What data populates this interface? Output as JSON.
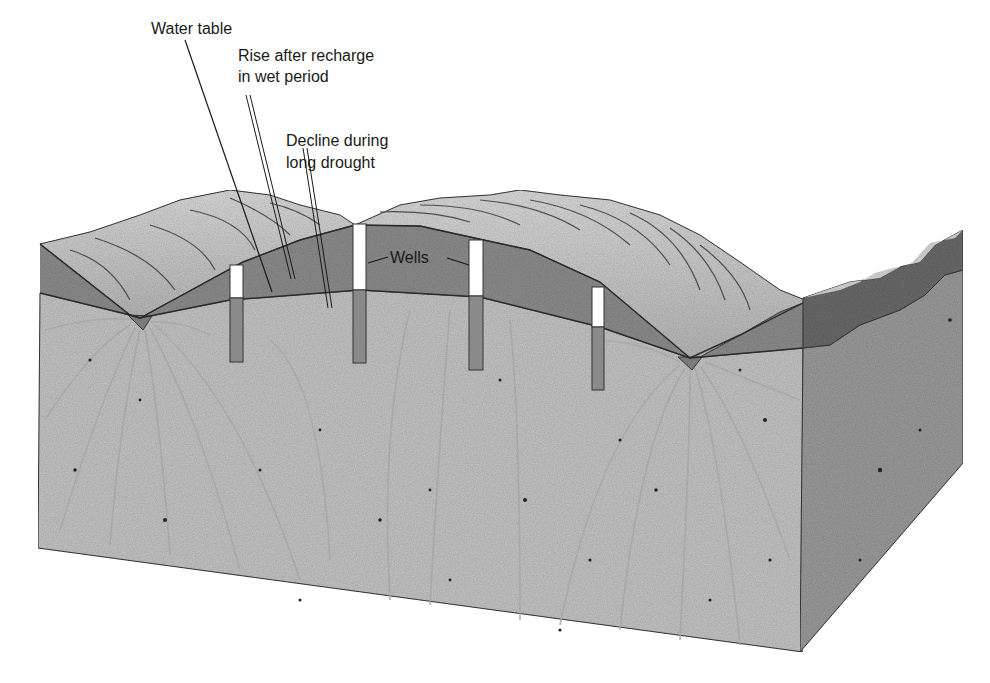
{
  "diagram": {
    "type": "block-diagram-cross-section",
    "labels": {
      "water_table": "Water table",
      "rise_line1": "Rise after recharge",
      "rise_line2": "in wet period",
      "decline_line1": "Decline during",
      "decline_line2": "long drought",
      "wells": "Wells"
    },
    "colors": {
      "background": "#ffffff",
      "hill_surface": "#c9c9c9",
      "hill_highlight": "#e2e2e2",
      "unsaturated_band": "#8f8f8f",
      "saturated_zone": "#c4c4c4",
      "right_face_saturated": "#9a9a9a",
      "right_face_band": "#6e6e6e",
      "well_casing_dry": "#ffffff",
      "well_casing_wet": "#8a8a8a",
      "flow_lines": "#a9a9a9",
      "outline": "#2a2a2a"
    },
    "wells": [
      {
        "id": 1,
        "x": 230,
        "width": 13,
        "top": 265,
        "water_level": 298,
        "bottom": 362
      },
      {
        "id": 2,
        "x": 353,
        "width": 13,
        "top": 224,
        "water_level": 290,
        "bottom": 363
      },
      {
        "id": 3,
        "x": 469,
        "width": 14,
        "top": 240,
        "water_level": 296,
        "bottom": 370
      },
      {
        "id": 4,
        "x": 592,
        "width": 12,
        "top": 287,
        "water_level": 327,
        "bottom": 390
      }
    ],
    "streams": [
      {
        "id": "left",
        "x": 140,
        "y": 316
      },
      {
        "id": "right",
        "x": 690,
        "y": 358
      }
    ]
  }
}
